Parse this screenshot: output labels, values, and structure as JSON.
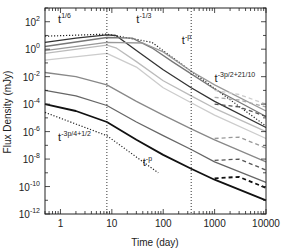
{
  "chart_data": {
    "type": "line",
    "title": "",
    "xlabel": "Time (day)",
    "ylabel": "Flux Density (mJy)",
    "xscale": "log",
    "yscale": "log",
    "xlim": [
      0.5,
      10000
    ],
    "ylim": [
      1e-12,
      1000
    ],
    "grid": false,
    "x_ticks": [
      {
        "value": 1,
        "label": "1"
      },
      {
        "value": 10,
        "label": "10"
      },
      {
        "value": 100,
        "label": "100"
      },
      {
        "value": 1000,
        "label": "1000"
      },
      {
        "value": 10000,
        "label": "10000"
      }
    ],
    "y_ticks": [
      {
        "value": 100,
        "base": "10",
        "exp": "2"
      },
      {
        "value": 1,
        "base": "10",
        "exp": "0"
      },
      {
        "value": 0.01,
        "base": "10",
        "exp": "-2"
      },
      {
        "value": 0.0001,
        "base": "10",
        "exp": "-4"
      },
      {
        "value": 1e-06,
        "base": "10",
        "exp": "-6"
      },
      {
        "value": 1e-08,
        "base": "10",
        "exp": "-8"
      },
      {
        "value": 1e-10,
        "base": "10",
        "exp": "-10"
      },
      {
        "value": 1e-12,
        "base": "10",
        "exp": "-12"
      }
    ],
    "vlines": [
      {
        "x": 8,
        "style": "dotted"
      },
      {
        "x": 350,
        "style": "dotted"
      }
    ],
    "annotations": [
      {
        "base": "t",
        "exp": "1/6",
        "x": 0.9,
        "y": 80
      },
      {
        "base": "t",
        "exp": "-1/3",
        "x": 30,
        "y": 80
      },
      {
        "base": "t",
        "exp": "-p",
        "x": 230,
        "y": 2.5
      },
      {
        "base": "t",
        "exp": "-3p/2+21/10",
        "x": 1000,
        "y": 0.004
      },
      {
        "base": "t",
        "exp": "-3p/4+1/2",
        "x": 0.9,
        "y": 2e-07
      },
      {
        "base": "t",
        "exp": "-p",
        "x": 40,
        "y": 3e-09
      }
    ],
    "series": [
      {
        "name": "asymptote-high",
        "style": "dotted",
        "color": "#222222",
        "x": [
          0.5,
          8,
          60,
          350,
          10000
        ],
        "log10_y": [
          0.95,
          1.1,
          0.5,
          -1.6,
          -5.6
        ]
      },
      {
        "name": "asymptote-low",
        "style": "dotted",
        "color": "#222222",
        "x": [
          0.5,
          8,
          80
        ],
        "log10_y": [
          -4.6,
          -6.3,
          -9.0
        ]
      },
      {
        "name": "curve-1",
        "style": "solid",
        "color": "#333333",
        "x": [
          0.5,
          2,
          8,
          12,
          30,
          100,
          350,
          1000,
          10000
        ],
        "log10_y": [
          0.5,
          0.8,
          1.05,
          1.0,
          -0.1,
          -1.5,
          -2.8,
          -3.8,
          -5.7
        ]
      },
      {
        "name": "curve-2",
        "style": "solid",
        "color": "#777777",
        "x": [
          0.5,
          8,
          25,
          60,
          150,
          350,
          1000,
          10000
        ],
        "log10_y": [
          0.2,
          0.85,
          0.8,
          0.1,
          -0.9,
          -1.8,
          -2.9,
          -4.9
        ]
      },
      {
        "name": "curve-3",
        "style": "solid",
        "color": "#999999",
        "x": [
          0.5,
          8,
          40,
          100,
          350,
          1000,
          10000
        ],
        "log10_y": [
          -0.1,
          0.5,
          0.45,
          -0.2,
          -1.6,
          -2.6,
          -4.5
        ]
      },
      {
        "name": "curve-4",
        "style": "solid",
        "color": "#bbbbbb",
        "x": [
          0.5,
          8,
          12,
          30,
          100,
          350,
          1000,
          10000
        ],
        "log10_y": [
          -0.3,
          0.3,
          0.1,
          -0.9,
          -2.3,
          -3.4,
          -4.3,
          -6.0
        ]
      },
      {
        "name": "curve-5",
        "style": "solid",
        "color": "#cccccc",
        "x": [
          0.5,
          8,
          30,
          100,
          350,
          1000,
          10000
        ],
        "log10_y": [
          -0.8,
          -0.3,
          -1.3,
          -2.8,
          -3.9,
          -4.8,
          -6.5
        ]
      },
      {
        "name": "curve-6",
        "style": "solid",
        "color": "#888888",
        "x": [
          0.5,
          2,
          8,
          30,
          100,
          350,
          1000,
          10000
        ],
        "log10_y": [
          -1.7,
          -2.0,
          -2.6,
          -3.8,
          -4.8,
          -5.8,
          -6.6,
          -8.2
        ]
      },
      {
        "name": "curve-7",
        "style": "solid",
        "color": "#666666",
        "x": [
          0.5,
          2,
          8,
          30,
          100,
          350,
          1000,
          10000
        ],
        "log10_y": [
          -3.0,
          -3.4,
          -4.1,
          -5.3,
          -6.3,
          -7.3,
          -8.2,
          -9.7
        ]
      },
      {
        "name": "curve-8",
        "style": "solid",
        "color": "#111111",
        "x": [
          0.5,
          2,
          8,
          30,
          100,
          350,
          1000,
          10000
        ],
        "log10_y": [
          -4.0,
          -4.5,
          -5.3,
          -6.6,
          -7.7,
          -8.7,
          -9.5,
          -11.0
        ]
      },
      {
        "name": "late-1",
        "style": "dashed",
        "color": "#aaaaaa",
        "x": [
          1000,
          3000,
          10000
        ],
        "log10_y": [
          -3.5,
          -3.7,
          -4.2
        ]
      },
      {
        "name": "late-2",
        "style": "dashed",
        "color": "#555555",
        "x": [
          1000,
          3000,
          10000
        ],
        "log10_y": [
          -4.0,
          -4.2,
          -4.9
        ]
      },
      {
        "name": "late-3",
        "style": "dashed",
        "color": "#cccccc",
        "x": [
          1000,
          3000,
          10000
        ],
        "log10_y": [
          -3.0,
          -3.3,
          -4.0
        ]
      },
      {
        "name": "late-6",
        "style": "dashed",
        "color": "#999999",
        "x": [
          1000,
          3000,
          10000
        ],
        "log10_y": [
          -6.5,
          -6.4,
          -7.2
        ]
      },
      {
        "name": "late-7",
        "style": "dashed",
        "color": "#555555",
        "x": [
          1000,
          3000,
          10000
        ],
        "log10_y": [
          -8.1,
          -8.0,
          -8.8
        ]
      },
      {
        "name": "late-8",
        "style": "dashed",
        "color": "#111111",
        "x": [
          1000,
          3000,
          10000
        ],
        "log10_y": [
          -9.4,
          -9.3,
          -10.1
        ]
      }
    ]
  }
}
